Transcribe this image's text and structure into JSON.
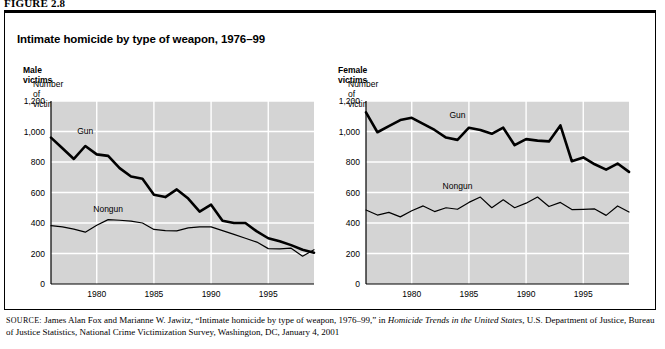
{
  "figure_label": "FIGURE 2.8",
  "panel_title": "Intimate homicide by type of weapon, 1976–99",
  "axis_caption": "Number of victims",
  "panels": [
    {
      "key": "male",
      "sex_label": "Male victims"
    },
    {
      "key": "female",
      "sex_label": "Female victims"
    }
  ],
  "source": {
    "prefix": "SOURCE:",
    "text_1": " James Alan Fox and Marianne W. Jawitz, “Intimate homicide by type of weapon, 1976–99,” in ",
    "italic_1": "Homicide Trends in the United States",
    "text_2": ", U.S. Department of Justice, Bureau of Justice Statistics, National Crime Victimization Survey, Washington, DC, January 4, 2001"
  },
  "colors": {
    "plot_background": "#d4d4d4",
    "gridline": "#ffffff",
    "axis": "#000000",
    "gun_line": "#000000",
    "nongun_line": "#000000",
    "page_background": "#ffffff"
  },
  "chart_data": [
    {
      "type": "line",
      "title": "Male victims",
      "subtitle": "Intimate homicide by type of weapon, 1976–99",
      "xlabel": "",
      "ylabel": "Number of victims",
      "ylim": [
        0,
        1200
      ],
      "yticks": [
        0,
        200,
        400,
        600,
        800,
        1000,
        1200
      ],
      "ytick_labels": [
        "0",
        "200",
        "400",
        "600",
        "800",
        "1,000",
        "1,200"
      ],
      "xlim": [
        1976,
        1999
      ],
      "xticks": [
        1980,
        1985,
        1990,
        1995
      ],
      "xtick_labels": [
        "1980",
        "1985",
        "1990",
        "1995"
      ],
      "x": [
        1976,
        1977,
        1978,
        1979,
        1980,
        1981,
        1982,
        1983,
        1984,
        1985,
        1986,
        1987,
        1988,
        1989,
        1990,
        1991,
        1992,
        1993,
        1994,
        1995,
        1996,
        1997,
        1998,
        1999
      ],
      "grid": true,
      "legend_position": "inline-annotation",
      "series": [
        {
          "name": "Gun",
          "label_x": 1979,
          "label_y": 985,
          "line_width": 2.6,
          "values": [
            960,
            890,
            820,
            905,
            850,
            840,
            760,
            705,
            690,
            585,
            570,
            620,
            560,
            475,
            520,
            415,
            400,
            400,
            345,
            300,
            280,
            255,
            225,
            205
          ]
        },
        {
          "name": "Nongun",
          "label_x": 1981,
          "label_y": 470,
          "line_width": 1.2,
          "values": [
            383,
            375,
            360,
            340,
            385,
            422,
            418,
            412,
            400,
            358,
            350,
            348,
            368,
            375,
            375,
            350,
            325,
            300,
            275,
            232,
            230,
            235,
            182,
            225
          ]
        }
      ]
    },
    {
      "type": "line",
      "title": "Female victims",
      "subtitle": "Intimate homicide by type of weapon, 1976–99",
      "xlabel": "",
      "ylabel": "Number of victims",
      "ylim": [
        0,
        1200
      ],
      "yticks": [
        0,
        200,
        400,
        600,
        800,
        1000,
        1200
      ],
      "ytick_labels": [
        "0",
        "200",
        "400",
        "600",
        "800",
        "1,000",
        "1,200"
      ],
      "xlim": [
        1976,
        1999
      ],
      "xticks": [
        1980,
        1985,
        1990,
        1995
      ],
      "xtick_labels": [
        "1980",
        "1985",
        "1990",
        "1995"
      ],
      "x": [
        1976,
        1977,
        1978,
        1979,
        1980,
        1981,
        1982,
        1983,
        1984,
        1985,
        1986,
        1987,
        1988,
        1989,
        1990,
        1991,
        1992,
        1993,
        1994,
        1995,
        1996,
        1997,
        1998,
        1999
      ],
      "grid": true,
      "legend_position": "inline-annotation",
      "series": [
        {
          "name": "Gun",
          "label_x": 1984,
          "label_y": 1090,
          "line_width": 2.6,
          "values": [
            1125,
            995,
            1035,
            1075,
            1090,
            1050,
            1010,
            960,
            945,
            1025,
            1010,
            985,
            1025,
            910,
            950,
            940,
            935,
            1040,
            805,
            830,
            785,
            750,
            790,
            735
          ]
        },
        {
          "name": "Nongun",
          "label_x": 1984,
          "label_y": 625,
          "line_width": 1.2,
          "values": [
            485,
            452,
            470,
            440,
            480,
            512,
            475,
            500,
            490,
            535,
            570,
            500,
            552,
            500,
            530,
            570,
            508,
            535,
            488,
            490,
            492,
            450,
            512,
            472
          ]
        }
      ]
    }
  ]
}
